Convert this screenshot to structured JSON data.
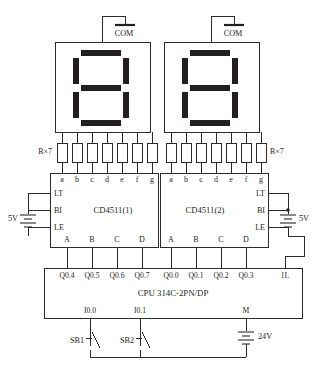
{
  "diagram": {
    "displays": [
      {
        "name": "seven-segment-display-1",
        "com_label": "COM",
        "lit_segments": [
          "a",
          "b",
          "c",
          "d",
          "e",
          "f",
          "g"
        ],
        "digit_shown": "8"
      },
      {
        "name": "seven-segment-display-2",
        "com_label": "COM",
        "lit_segments": [
          "a",
          "b",
          "c",
          "d",
          "e",
          "f",
          "g"
        ],
        "digit_shown": "8"
      }
    ],
    "resistor_banks": [
      {
        "label": "R×7",
        "count": 7,
        "side": "left"
      },
      {
        "label": "R×7",
        "count": 7,
        "side": "right"
      }
    ],
    "ics": [
      {
        "name": "CD4511(1)",
        "label": "CD4511(1)",
        "segment_pins": [
          "a",
          "b",
          "c",
          "d",
          "e",
          "f",
          "g"
        ],
        "control_pins": [
          "LT",
          "BI",
          "LE"
        ],
        "control_side": "left",
        "data_pins": [
          "A",
          "B",
          "C",
          "D"
        ],
        "supply_label": "5V"
      },
      {
        "name": "CD4511(2)",
        "label": "CD4511(2)",
        "segment_pins": [
          "a",
          "b",
          "c",
          "d",
          "e",
          "f",
          "g"
        ],
        "control_pins": [
          "LT",
          "BI",
          "LE"
        ],
        "control_side": "right",
        "data_pins": [
          "A",
          "B",
          "C",
          "D"
        ],
        "supply_label": "5V"
      }
    ],
    "cpu": {
      "label": "CPU 314C-2PN/DP",
      "output_terminals": [
        "Q0.4",
        "Q0.5",
        "Q0.6",
        "Q0.7",
        "Q0.0",
        "Q0.1",
        "Q0.2",
        "Q0.3"
      ],
      "power_terminal": "1L",
      "input_terminals": [
        "I0.0",
        "I0.1"
      ],
      "common_terminal": "M"
    },
    "switches": [
      {
        "name": "push-button-sb1",
        "label": "SB1",
        "connects_to": "I0.0"
      },
      {
        "name": "push-button-sb2",
        "label": "SB2",
        "connects_to": "I0.1"
      }
    ],
    "power_supplies": [
      {
        "name": "supply-5v-left",
        "label": "5V"
      },
      {
        "name": "supply-5v-right",
        "label": "5V"
      },
      {
        "name": "supply-24v",
        "label": "24V"
      }
    ],
    "colors": {
      "line": "#2b2b2b",
      "segment_fill": "#231f20",
      "background": "#ffffff"
    }
  }
}
